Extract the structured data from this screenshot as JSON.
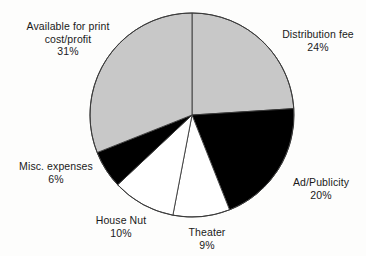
{
  "chart_data": {
    "type": "pie",
    "title": "",
    "subtitle": "",
    "xlabel": "",
    "ylabel": "",
    "legend_position": "none",
    "grid": false,
    "units": "percent",
    "start_angle_deg": 0,
    "direction": "clockwise",
    "categories": [
      "Distribution fee",
      "Ad/Publicity",
      "Theater",
      "House Nut",
      "Misc. expenses",
      "Available for print cost/profit"
    ],
    "values": [
      24,
      20,
      9,
      10,
      6,
      31
    ],
    "total": 100,
    "slices": [
      {
        "id": "distribution",
        "label": "Distribution fee",
        "label_line1": "Distribution fee",
        "value": 24,
        "value_text": "24%",
        "color": "#c8c8c8",
        "fill_name": "gray"
      },
      {
        "id": "adpublicity",
        "label": "Ad/Publicity",
        "label_line1": "Ad/Publicity",
        "value": 20,
        "value_text": "20%",
        "color": "#000000",
        "fill_name": "black"
      },
      {
        "id": "theater",
        "label": "Theater",
        "label_line1": "Theater",
        "value": 9,
        "value_text": "9%",
        "color": "#ffffff",
        "fill_name": "white"
      },
      {
        "id": "housenut",
        "label": "House Nut",
        "label_line1": "House Nut",
        "value": 10,
        "value_text": "10%",
        "color": "#ffffff",
        "fill_name": "white"
      },
      {
        "id": "misc",
        "label": "Misc. expenses",
        "label_line1": "Misc. expenses",
        "value": 6,
        "value_text": "6%",
        "color": "#000000",
        "fill_name": "black"
      },
      {
        "id": "available",
        "label": "Available for print cost/profit",
        "label_line1": "Available for print",
        "label_line2": "cost/profit",
        "value": 31,
        "value_text": "31%",
        "color": "#c8c8c8",
        "fill_name": "gray"
      }
    ],
    "colors": {
      "gray": "#c8c8c8",
      "black": "#000000",
      "white": "#ffffff",
      "outline": "#3a3a3a",
      "background": "#fdfdfc",
      "text": "#1a1a1a"
    }
  }
}
